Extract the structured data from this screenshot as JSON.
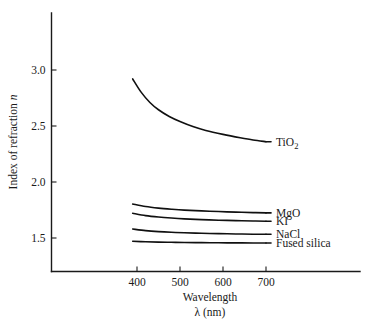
{
  "chart_data": {
    "type": "line",
    "title": "",
    "xlabel": "Wavelength",
    "xlabel_line2": "λ (nm)",
    "ylabel": "Index of refraction n",
    "ylabel_text": "Index of refraction ",
    "ylabel_italic": "n",
    "xlim": [
      320,
      760
    ],
    "ylim": [
      1.28,
      3.22
    ],
    "grid": false,
    "legend_position": "right-of-curve-ends",
    "xticks": [
      400,
      500,
      600,
      700
    ],
    "xtick_labels": [
      "400",
      "500",
      "600",
      "700"
    ],
    "yticks": [
      1.5,
      2.0,
      2.5,
      3.0
    ],
    "ytick_labels": [
      "1.5",
      "2.0",
      "2.5",
      "3.0"
    ],
    "series": [
      {
        "name": "TiO2",
        "label": "TiO",
        "label_sub": "2",
        "x": [
          390,
          410,
          430,
          450,
          475,
          500,
          530,
          560,
          600,
          640,
          670,
          700
        ],
        "values": [
          2.92,
          2.8,
          2.71,
          2.645,
          2.585,
          2.54,
          2.495,
          2.46,
          2.425,
          2.395,
          2.375,
          2.36
        ]
      },
      {
        "name": "MgO",
        "label": "MgO",
        "label_sub": "",
        "x": [
          390,
          420,
          450,
          480,
          510,
          550,
          590,
          630,
          670,
          700
        ],
        "values": [
          1.803,
          1.781,
          1.767,
          1.757,
          1.749,
          1.742,
          1.736,
          1.731,
          1.727,
          1.724
        ]
      },
      {
        "name": "KI",
        "label": "KI",
        "label_sub": "",
        "x": [
          390,
          420,
          450,
          480,
          510,
          550,
          590,
          630,
          670,
          700
        ],
        "values": [
          1.721,
          1.7,
          1.687,
          1.678,
          1.671,
          1.664,
          1.659,
          1.655,
          1.652,
          1.65
        ]
      },
      {
        "name": "NaCl",
        "label": "NaCl",
        "label_sub": "",
        "x": [
          390,
          420,
          450,
          480,
          510,
          550,
          590,
          630,
          670,
          700
        ],
        "values": [
          1.58,
          1.566,
          1.557,
          1.551,
          1.547,
          1.542,
          1.539,
          1.536,
          1.534,
          1.533
        ]
      },
      {
        "name": "Fused silica",
        "label": "Fused silica",
        "label_sub": "",
        "x": [
          390,
          420,
          450,
          480,
          510,
          550,
          590,
          630,
          670,
          700
        ],
        "values": [
          1.4706,
          1.4664,
          1.4636,
          1.4617,
          1.4601,
          1.4585,
          1.4573,
          1.4564,
          1.4556,
          1.4551
        ]
      }
    ]
  },
  "figure": {
    "background_color": "#ffffff",
    "ink_color": "#1a1a1a"
  }
}
